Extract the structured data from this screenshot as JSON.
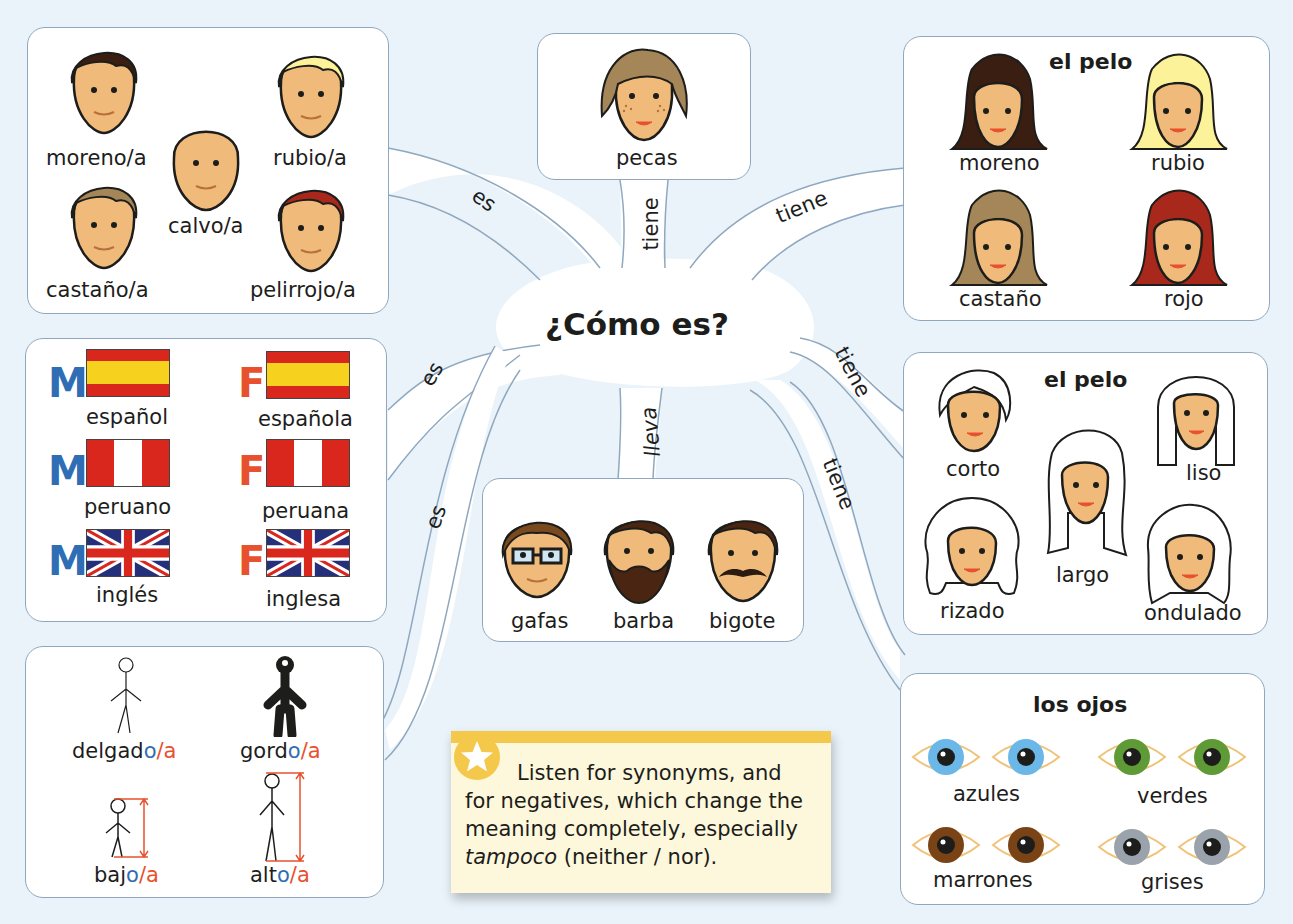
{
  "center": {
    "title": "¿Cómo es?"
  },
  "edges": {
    "hair_men": "es",
    "pecas": "tiene",
    "hair_colour": "tiene",
    "nationality": "es",
    "build": "es",
    "accessories": "lleva",
    "hair_style": "tiene",
    "eyes": "tiene"
  },
  "hair_men": {
    "items": [
      {
        "label": "moreno/a",
        "hair": "#3a1e12"
      },
      {
        "label": "rubio/a",
        "hair": "#fbf29a"
      },
      {
        "label": "calvo/a",
        "hair": "none"
      },
      {
        "label": "castaño/a",
        "hair": "#a48658"
      },
      {
        "label": "pelirrojo/a",
        "hair": "#a8291c"
      }
    ]
  },
  "pecas": {
    "label": "pecas"
  },
  "hair_colour": {
    "title": "el pelo",
    "items": [
      {
        "label": "moreno",
        "hair": "#3a1e12"
      },
      {
        "label": "rubio",
        "hair": "#fbf29a"
      },
      {
        "label": "castaño",
        "hair": "#a48658"
      },
      {
        "label": "rojo",
        "hair": "#a8291c"
      }
    ]
  },
  "nationality": {
    "masc_mark": "M",
    "fem_mark": "F",
    "items": [
      {
        "masc": "español",
        "fem": "española",
        "flag": "spain"
      },
      {
        "masc": "peruano",
        "fem": "peruana",
        "flag": "peru"
      },
      {
        "masc": "inglés",
        "fem": "inglesa",
        "flag": "uk"
      }
    ]
  },
  "hair_style": {
    "title": "el pelo",
    "items": [
      "corto",
      "liso",
      "largo",
      "rizado",
      "ondulado"
    ]
  },
  "accessories": {
    "items": [
      "gafas",
      "barba",
      "bigote"
    ]
  },
  "build": {
    "items": [
      {
        "stem": "delgad",
        "o": "o",
        "sep": "/",
        "a": "a"
      },
      {
        "stem": "gord",
        "o": "o",
        "sep": "/",
        "a": "a"
      },
      {
        "stem": "baj",
        "o": "o",
        "sep": "/",
        "a": "a"
      },
      {
        "stem": "alt",
        "o": "o",
        "sep": "/",
        "a": "a"
      }
    ]
  },
  "eyes": {
    "title": "los ojos",
    "items": [
      {
        "label": "azules",
        "color": "#6bb8e8"
      },
      {
        "label": "verdes",
        "color": "#5e9a35"
      },
      {
        "label": "marrones",
        "color": "#7a4316"
      },
      {
        "label": "grises",
        "color": "#9aa3ab"
      }
    ]
  },
  "tip": {
    "line1": "Listen for synonyms, and",
    "line2": "for negatives, which change the",
    "line3": "meaning completely, especially",
    "italic_word": "tampoco",
    "line4_rest": " (neither / nor)."
  },
  "colors": {
    "background": "#eaf3fa",
    "outline": "#8fa8bf",
    "masc": "#2f6db5",
    "fem": "#e8512d",
    "tip_yellow": "#f4c84a",
    "skin": "#f0bb7a"
  }
}
